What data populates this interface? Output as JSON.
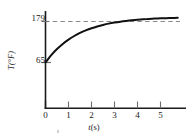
{
  "chart_data": {
    "type": "line",
    "title": "",
    "xlabel": "t(s)",
    "ylabel": "T(°F)",
    "xlabel_variable": "t",
    "xlabel_unit": "(s)",
    "xlim": [
      -0.2,
      6.1
    ],
    "ylim": [
      40,
      200
    ],
    "grid": false,
    "legend": null,
    "y_tick_labels": [
      "179",
      "65"
    ],
    "y_ticks": [
      179,
      65
    ],
    "x_tick_labels": [
      "0",
      "1",
      "2",
      "3",
      "4",
      "5"
    ],
    "x_ticks": [
      0,
      1,
      2,
      3,
      4,
      5
    ],
    "initial_value": 65,
    "asymptote_value": 179,
    "asymptote_style": "dashed",
    "asymptote_color": "#8a8a8a",
    "curve_color": "#111111",
    "axis_color": "#1a1a1a",
    "background_color": "#ffffff",
    "series": [
      {
        "name": "temperature",
        "x": [
          0,
          0.25,
          0.5,
          0.75,
          1,
          1.25,
          1.5,
          1.75,
          2,
          2.25,
          2.5,
          2.75,
          3,
          3.25,
          3.5,
          3.75,
          4,
          4.25,
          4.5,
          4.75,
          5,
          5.25,
          5.5,
          5.75,
          6
        ],
        "y": [
          65,
          85.3,
          102.3,
          116.6,
          128.6,
          138.7,
          147.2,
          154.3,
          160.3,
          165.3,
          169.5,
          173.1,
          176.0,
          178.5,
          180.6,
          182.3,
          183.8,
          185.0,
          186.1,
          187.0,
          187.7,
          188.3,
          188.9,
          189.3,
          189.7
        ]
      }
    ]
  },
  "labels": {
    "y_top": "179",
    "y_bottom": "65",
    "x0": "0",
    "x1": "1",
    "x2": "2",
    "x3": "3",
    "x4": "4",
    "x5": "5",
    "x_axis_variable": "t",
    "x_axis_unit": "(s)",
    "y_axis_title": "T(°F)"
  }
}
